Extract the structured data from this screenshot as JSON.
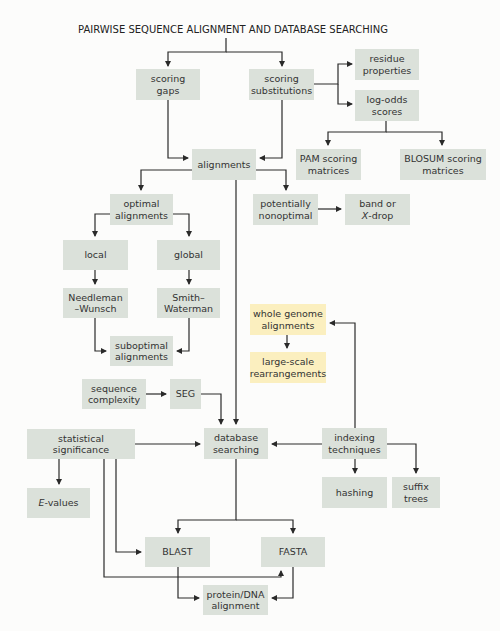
{
  "title": "PAIRWISE SEQUENCE ALIGNMENT AND DATABASE SEARCHING",
  "colors": {
    "box": "#dbe1da",
    "highlight_box": "#fbefbf",
    "line": "#2a2a2a"
  },
  "nodes": {
    "scoring_gaps": "scoring\ngaps",
    "scoring_substitutions": "scoring\nsubstitutions",
    "residue_properties": "residue\nproperties",
    "log_odds_scores": "log-odds\nscores",
    "pam": "PAM scoring\nmatrices",
    "blosum": "BLOSUM scoring\nmatrices",
    "alignments": "alignments",
    "optimal_alignments": "optimal\nalignments",
    "potentially_nonoptimal": "potentially\nnonoptimal",
    "band_or": "band or",
    "x_drop_italic": "X",
    "x_drop_rest": "-drop",
    "local": "local",
    "global": "global",
    "needleman_wunsch": "Needleman\n–Wunsch",
    "smith_waterman": "Smith–\nWaterman",
    "suboptimal_alignments": "suboptimal\nalignments",
    "whole_genome_alignments": "whole genome\nalignments",
    "large_scale_rearrangements": "large-scale\nrearrangements",
    "sequence_complexity": "sequence\ncomplexity",
    "seg": "SEG",
    "statistical_significance": "statistical significance",
    "database_searching": "database\nsearching",
    "indexing_techniques": "indexing\ntechniques",
    "e_values_italic": "E",
    "e_values_rest": "-values",
    "hashing": "hashing",
    "suffix_trees": "suffix\ntrees",
    "blast": "BLAST",
    "fasta": "FASTA",
    "protein_dna_alignment": "protein/DNA\nalignment"
  },
  "edges": [
    [
      "title",
      "scoring_gaps"
    ],
    [
      "title",
      "scoring_substitutions"
    ],
    [
      "scoring_substitutions",
      "residue_properties"
    ],
    [
      "scoring_substitutions",
      "log_odds_scores"
    ],
    [
      "log_odds_scores",
      "pam"
    ],
    [
      "log_odds_scores",
      "blosum"
    ],
    [
      "scoring_gaps",
      "alignments"
    ],
    [
      "scoring_substitutions",
      "alignments"
    ],
    [
      "alignments",
      "optimal_alignments"
    ],
    [
      "alignments",
      "potentially_nonoptimal"
    ],
    [
      "alignments",
      "database_searching"
    ],
    [
      "potentially_nonoptimal",
      "band_or_x_drop"
    ],
    [
      "optimal_alignments",
      "local"
    ],
    [
      "optimal_alignments",
      "global"
    ],
    [
      "local",
      "needleman_wunsch"
    ],
    [
      "global",
      "smith_waterman"
    ],
    [
      "needleman_wunsch",
      "suboptimal_alignments"
    ],
    [
      "smith_waterman",
      "suboptimal_alignments"
    ],
    [
      "whole_genome_alignments",
      "large_scale_rearrangements"
    ],
    [
      "indexing_techniques",
      "whole_genome_alignments"
    ],
    [
      "sequence_complexity",
      "seg"
    ],
    [
      "seg",
      "database_searching"
    ],
    [
      "statistical_significance",
      "database_searching"
    ],
    [
      "statistical_significance",
      "e_values"
    ],
    [
      "statistical_significance",
      "blast"
    ],
    [
      "statistical_significance",
      "fasta"
    ],
    [
      "indexing_techniques",
      "database_searching"
    ],
    [
      "indexing_techniques",
      "hashing"
    ],
    [
      "indexing_techniques",
      "suffix_trees"
    ],
    [
      "database_searching",
      "blast"
    ],
    [
      "database_searching",
      "fasta"
    ],
    [
      "blast",
      "protein_dna_alignment"
    ],
    [
      "fasta",
      "protein_dna_alignment"
    ]
  ]
}
